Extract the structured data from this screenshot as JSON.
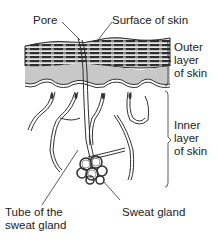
{
  "diagram": {
    "labels": {
      "pore": "Pore",
      "surface": "Surface of skin",
      "outer_layer": [
        "Outer",
        "layer",
        "of skin"
      ],
      "inner_layer": [
        "Inner",
        "layer",
        "of skin"
      ],
      "tube": [
        "Tube of the",
        "sweat gland"
      ],
      "sweat_gland": "Sweat gland"
    },
    "colors": {
      "outer_fill": "#c8c8c8",
      "stripes": "#3a3a3a",
      "line": "#333333",
      "background": "#ffffff"
    }
  }
}
